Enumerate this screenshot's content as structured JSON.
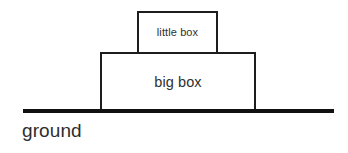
{
  "diagram": {
    "background_color": "#ffffff",
    "stroke_color": "#1d1d1d",
    "ground_color": "#111111",
    "text_color": "#303030",
    "shapes": [
      {
        "name": "little-box",
        "label": "little box",
        "x": 137,
        "y": 11,
        "width": 81,
        "height": 43,
        "border_width": 2,
        "open_bottom": true
      },
      {
        "name": "big-box",
        "label": "big box",
        "x": 100,
        "y": 52,
        "width": 156,
        "height": 60,
        "border_width": 2,
        "open_bottom": true
      }
    ],
    "ground": {
      "label": "ground",
      "x": 23,
      "y": 109,
      "width": 311,
      "thickness": 4
    }
  }
}
